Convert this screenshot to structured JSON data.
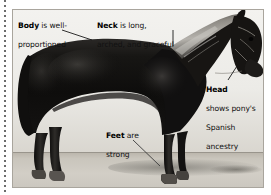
{
  "figure": {
    "background_color": "#ffffff",
    "photo_border_color": "#aaa69e"
  },
  "decor": {
    "left_rule": "dotted-vertical-rule"
  },
  "annotations": [
    {
      "id": "body",
      "name": "callout-body",
      "bold": "Body",
      "rest": " is well-",
      "line2": "proportioned",
      "leader": "diagonal-down-right"
    },
    {
      "id": "neck",
      "name": "callout-neck",
      "bold": "Neck",
      "rest": " is long,",
      "line2": "arched, and graceful",
      "leader": "vertical-down"
    },
    {
      "id": "head",
      "name": "callout-head",
      "bold": "Head",
      "rest": "",
      "line2": "shows pony's",
      "line3": "Spanish",
      "line4": "ancestry",
      "leader": "short-diagonal-up-right"
    },
    {
      "id": "feet",
      "name": "callout-feet",
      "bold": "Feet",
      "rest": " are",
      "line2": "strong",
      "leader": "diagonal-down-right"
    }
  ],
  "colors": {
    "horse_body": "#141414",
    "horse_highlight": "#5c5a57",
    "mane": "#9a968f",
    "sky": "#efeeea",
    "ground": "#cbc7bf",
    "text": "#111111"
  }
}
